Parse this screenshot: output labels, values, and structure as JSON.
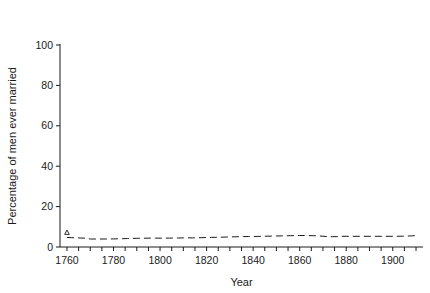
{
  "chart_data": {
    "type": "scatter",
    "title": "",
    "xlabel": "Year",
    "ylabel": "Percentage of men ever married",
    "xlim": [
      1757,
      1913
    ],
    "ylim": [
      0,
      100
    ],
    "xticks_labeled": [
      1760,
      1780,
      1800,
      1820,
      1840,
      1860,
      1880,
      1900
    ],
    "xticks_minor_step": 5,
    "yticks": [
      0,
      20,
      40,
      60,
      80,
      100
    ],
    "grid": false,
    "legend_position": "top",
    "legend": {
      "row_labels": [
        "Raw",
        "Smoothed"
      ],
      "groups": [
        "1-16",
        "16-25",
        "26-35",
        "36-45"
      ],
      "raw_markers": [
        "triangle",
        "square",
        "circle",
        "cross"
      ],
      "smoothed_styles": [
        "dashed",
        "dash-short",
        "dotted",
        "solid"
      ]
    },
    "series": [
      {
        "name": "1-16",
        "marker": "triangle",
        "line_style": "dashed",
        "x": [
          1760,
          1762,
          1764,
          1766,
          1768,
          1770,
          1772,
          1774,
          1776,
          1778,
          1780,
          1782,
          1784,
          1786,
          1788,
          1790,
          1792,
          1794,
          1796,
          1798,
          1800,
          1802,
          1804,
          1806,
          1808,
          1810,
          1812,
          1814,
          1816,
          1818,
          1820,
          1822,
          1824,
          1826,
          1828,
          1830,
          1832,
          1834,
          1836,
          1838,
          1840,
          1842,
          1844,
          1846,
          1848,
          1850,
          1852,
          1854,
          1856,
          1858,
          1860,
          1862,
          1864,
          1866,
          1868,
          1870,
          1872,
          1874,
          1876,
          1878,
          1880,
          1900,
          1904,
          1908,
          1911
        ],
        "y": [
          7.2,
          4.3,
          4.0,
          4.3,
          4.0,
          3.9,
          4.1,
          3.8,
          3.5,
          3.9,
          4.0,
          4.1,
          4.2,
          4.0,
          4.3,
          4.9,
          4.3,
          4.1,
          4.3,
          4.5,
          4.4,
          4.3,
          4.6,
          4.3,
          4.4,
          4.6,
          4.4,
          4.5,
          4.7,
          4.9,
          4.5,
          4.4,
          4.6,
          5.0,
          5.2,
          5.0,
          4.8,
          5.1,
          5.4,
          5.3,
          5.0,
          5.2,
          5.5,
          5.3,
          5.4,
          5.1,
          5.5,
          5.8,
          5.6,
          5.4,
          5.7,
          5.9,
          6.1,
          5.8,
          5.6,
          5.5,
          5.3,
          5.0,
          4.6,
          4.2,
          3.9,
          6.0,
          6.2,
          7.0,
          5.6
        ],
        "smoothed_y_start": 5.5,
        "smoothed_y_end": 6.6
      },
      {
        "name": "16-25",
        "marker": "square",
        "line_style": "dash-short",
        "x": [
          1760,
          1762,
          1764,
          1766,
          1768,
          1770,
          1772,
          1774,
          1776,
          1778,
          1780,
          1782,
          1784,
          1786,
          1788,
          1790,
          1792,
          1794,
          1796,
          1798,
          1800,
          1802,
          1804,
          1806,
          1808,
          1810,
          1812,
          1814,
          1816,
          1818,
          1820,
          1822,
          1824,
          1826,
          1828,
          1830,
          1832,
          1834,
          1836,
          1838,
          1840,
          1842,
          1844,
          1846,
          1848,
          1850,
          1852,
          1854,
          1856,
          1858,
          1860,
          1862,
          1864,
          1866,
          1868,
          1870,
          1872,
          1874,
          1876,
          1878,
          1880,
          1884,
          1888,
          1892,
          1896,
          1900,
          1904,
          1908,
          1911
        ],
        "y": [
          31.5,
          34.0,
          34.8,
          35.2,
          35.0,
          36.5,
          38.0,
          37.0,
          38.5,
          39.5,
          38.8,
          41.5,
          42.5,
          44.0,
          41.5,
          43.0,
          40.5,
          44.5,
          46.0,
          43.0,
          43.5,
          43.0,
          44.5,
          42.0,
          50.0,
          39.5,
          41.0,
          44.5,
          45.0,
          43.5,
          44.0,
          40.5,
          42.0,
          46.0,
          49.5,
          48.5,
          51.0,
          49.5,
          46.5,
          44.5,
          45.5,
          43.0,
          44.0,
          46.5,
          46.5,
          46.5,
          46.0,
          47.5,
          48.5,
          43.5,
          43.5,
          48.0,
          50.5,
          50.5,
          47.0,
          48.5,
          47.0,
          48.5,
          44.5,
          50.5,
          51.5,
          52.0,
          53.5,
          54.0,
          52.5,
          53.5,
          47.0,
          54.5,
          50.0
        ],
        "smoothed_y_start": 33.0,
        "smoothed_y_end": 51.5
      },
      {
        "name": "26-35",
        "marker": "circle",
        "line_style": "dotted",
        "x": [
          1760,
          1762,
          1764,
          1766,
          1768,
          1770,
          1772,
          1774,
          1776,
          1778,
          1780,
          1782,
          1784,
          1786,
          1788,
          1790,
          1792,
          1794,
          1796,
          1798,
          1800,
          1802,
          1804,
          1806,
          1808,
          1810,
          1812,
          1814,
          1816,
          1818,
          1820,
          1822,
          1824,
          1826,
          1828,
          1830,
          1832,
          1834,
          1836,
          1838,
          1840,
          1842,
          1844,
          1846,
          1848,
          1850,
          1852,
          1854,
          1856,
          1858,
          1860,
          1862,
          1864,
          1866,
          1868,
          1870,
          1872,
          1874,
          1876,
          1878,
          1880,
          1884,
          1888,
          1892,
          1896,
          1900,
          1904,
          1908,
          1911
        ],
        "y": [
          67.0,
          66.5,
          69.5,
          71.0,
          72.5,
          74.5,
          75.0,
          76.0,
          76.5,
          77.5,
          77.0,
          79.0,
          78.5,
          79.5,
          80.0,
          79.0,
          80.0,
          79.5,
          79.0,
          78.5,
          79.5,
          78.0,
          79.0,
          78.5,
          78.0,
          77.5,
          77.0,
          77.5,
          78.0,
          77.0,
          76.5,
          76.0,
          75.0,
          74.0,
          74.5,
          73.5,
          73.0,
          74.0,
          73.5,
          74.5,
          73.0,
          73.5,
          74.0,
          73.5,
          73.0,
          73.5,
          73.0,
          72.5,
          72.0,
          72.0,
          71.5,
          71.5,
          72.0,
          72.5,
          71.5,
          71.0,
          72.0,
          71.5,
          71.0,
          71.5,
          72.0,
          72.0,
          72.5,
          73.5,
          74.0,
          74.5,
          75.0,
          76.5,
          77.0
        ],
        "smoothed_y_start": 69.0,
        "smoothed_y_end": 76.5
      },
      {
        "name": "36-45",
        "marker": "cross",
        "line_style": "solid",
        "x": [
          1760,
          1762,
          1764,
          1766,
          1768,
          1770,
          1772,
          1774,
          1776,
          1778,
          1780,
          1782,
          1784,
          1786,
          1788,
          1790,
          1792,
          1794,
          1796,
          1798,
          1800,
          1802,
          1804,
          1806,
          1808,
          1810,
          1812,
          1814,
          1816,
          1818,
          1820,
          1822,
          1824,
          1826,
          1828,
          1830,
          1832,
          1834,
          1836,
          1838,
          1840,
          1842,
          1844,
          1846,
          1848,
          1850,
          1852,
          1854,
          1856,
          1858,
          1860,
          1862,
          1864,
          1866,
          1868,
          1870,
          1872,
          1874,
          1876,
          1878,
          1880,
          1884,
          1888,
          1892,
          1896,
          1900,
          1904,
          1908,
          1911
        ],
        "y": [
          83.5,
          83.0,
          84.5,
          83.5,
          83.0,
          84.5,
          85.5,
          85.0,
          86.0,
          87.5,
          87.0,
          88.5,
          90.0,
          88.5,
          88.5,
          88.0,
          88.0,
          87.5,
          88.0,
          88.5,
          88.0,
          87.5,
          88.5,
          88.0,
          87.5,
          87.0,
          87.5,
          86.5,
          86.5,
          87.0,
          87.5,
          87.0,
          86.5,
          88.5,
          87.5,
          87.0,
          87.0,
          86.0,
          85.5,
          85.0,
          84.5,
          83.5,
          84.0,
          83.0,
          82.5,
          82.0,
          83.5,
          82.5,
          82.0,
          82.5,
          83.0,
          84.0,
          84.5,
          83.5,
          83.0,
          82.5,
          82.0,
          84.0,
          85.0,
          82.5,
          83.0,
          84.5,
          85.0,
          85.0,
          85.5,
          86.5,
          85.0,
          86.0,
          85.5
        ],
        "smoothed_y_start": 83.5,
        "smoothed_y_end": 86.0
      }
    ]
  }
}
